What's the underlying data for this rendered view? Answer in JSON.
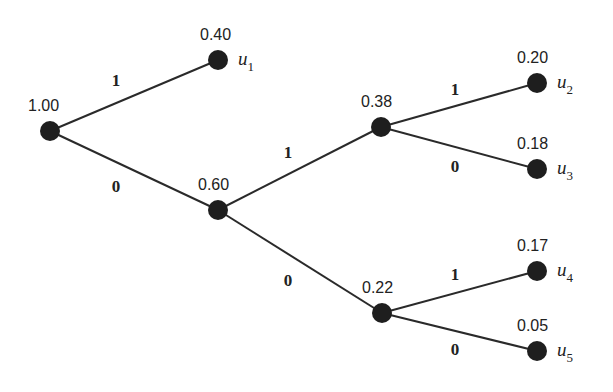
{
  "diagram": {
    "type": "huffman-code-tree",
    "nodes": [
      {
        "id": "root",
        "prob": "1.00",
        "x": 50,
        "y": 131,
        "label_dx": -22,
        "label_dy": -20
      },
      {
        "id": "u1",
        "prob": "0.40",
        "x": 218,
        "y": 60,
        "label_dx": -18,
        "label_dy": -20,
        "symbol": "u",
        "sub": "1"
      },
      {
        "id": "n060",
        "prob": "0.60",
        "x": 218,
        "y": 210,
        "label_dx": -20,
        "label_dy": -20
      },
      {
        "id": "n038",
        "prob": "0.38",
        "x": 381,
        "y": 127,
        "label_dx": -20,
        "label_dy": -20
      },
      {
        "id": "n022",
        "prob": "0.22",
        "x": 382,
        "y": 313,
        "label_dx": -20,
        "label_dy": -20
      },
      {
        "id": "u2",
        "prob": "0.20",
        "x": 537,
        "y": 83,
        "label_dx": -20,
        "label_dy": -20,
        "symbol": "u",
        "sub": "2"
      },
      {
        "id": "u3",
        "prob": "0.18",
        "x": 537,
        "y": 169,
        "label_dx": -20,
        "label_dy": -20,
        "symbol": "u",
        "sub": "3"
      },
      {
        "id": "u4",
        "prob": "0.17",
        "x": 537,
        "y": 271,
        "label_dx": -20,
        "label_dy": -20,
        "symbol": "u",
        "sub": "4"
      },
      {
        "id": "u5",
        "prob": "0.05",
        "x": 537,
        "y": 351,
        "label_dx": -20,
        "label_dy": -20,
        "symbol": "u",
        "sub": "5"
      }
    ],
    "edges": [
      {
        "from": "root",
        "to": "u1",
        "bit": "1",
        "lx": 116,
        "ly": 86
      },
      {
        "from": "root",
        "to": "n060",
        "bit": "0",
        "lx": 116,
        "ly": 192
      },
      {
        "from": "n060",
        "to": "n038",
        "bit": "1",
        "lx": 288,
        "ly": 158
      },
      {
        "from": "n060",
        "to": "n022",
        "bit": "0",
        "lx": 288,
        "ly": 286
      },
      {
        "from": "n038",
        "to": "u2",
        "bit": "1",
        "lx": 455,
        "ly": 95
      },
      {
        "from": "n038",
        "to": "u3",
        "bit": "0",
        "lx": 455,
        "ly": 172
      },
      {
        "from": "n022",
        "to": "u4",
        "bit": "1",
        "lx": 455,
        "ly": 280
      },
      {
        "from": "n022",
        "to": "u5",
        "bit": "0",
        "lx": 455,
        "ly": 355
      }
    ],
    "node_radius": 10
  }
}
